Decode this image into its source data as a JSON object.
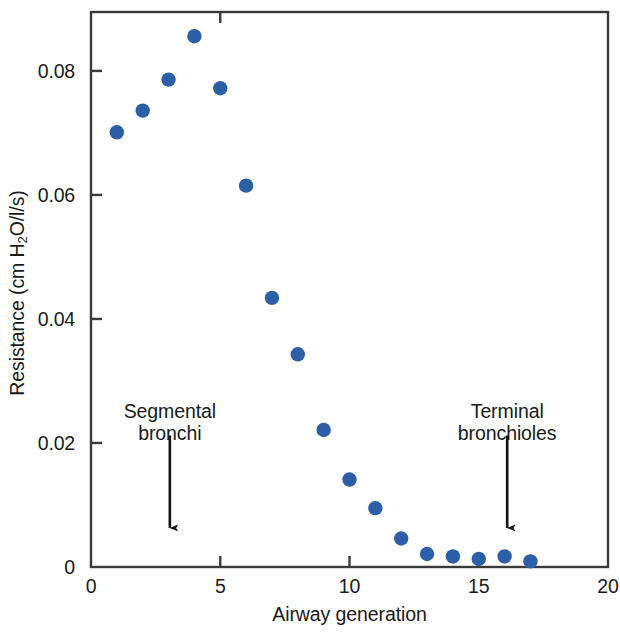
{
  "chart_data": {
    "type": "scatter",
    "title": "",
    "xlabel": "Airway generation",
    "ylabel": "Resistance (cm H2O/l/s)",
    "ylabel_parts": {
      "pre": "Resistance (cm H",
      "sub": "2",
      "post": "O/l/s)"
    },
    "xlim": [
      0,
      20
    ],
    "ylim": [
      0,
      0.0895
    ],
    "xticks": [
      0,
      5,
      10,
      15,
      20
    ],
    "xtick_labels": [
      "0",
      "5",
      "10",
      "15",
      "20"
    ],
    "yticks": [
      0,
      0.02,
      0.04,
      0.06,
      0.08
    ],
    "ytick_labels": [
      "0",
      "0.02",
      "0.04",
      "0.06",
      "0.08"
    ],
    "grid": false,
    "legend": null,
    "marker_color": "#2d5fa6",
    "axis_color": "#3a3a3a",
    "x": [
      1,
      2,
      3,
      4,
      5,
      6,
      7,
      8,
      9,
      10,
      11,
      12,
      13,
      14,
      15,
      16,
      17
    ],
    "values": [
      0.0701,
      0.0736,
      0.0786,
      0.0856,
      0.0772,
      0.0615,
      0.0434,
      0.0343,
      0.0221,
      0.0141,
      0.0095,
      0.0046,
      0.0021,
      0.0017,
      0.0013,
      0.0017,
      0.0009
    ],
    "points": [
      {
        "x": 1,
        "y": 0.0701
      },
      {
        "x": 2,
        "y": 0.0736
      },
      {
        "x": 3,
        "y": 0.0786
      },
      {
        "x": 4,
        "y": 0.0856
      },
      {
        "x": 5,
        "y": 0.0772
      },
      {
        "x": 6,
        "y": 0.0615
      },
      {
        "x": 7,
        "y": 0.0434
      },
      {
        "x": 8,
        "y": 0.0343
      },
      {
        "x": 9,
        "y": 0.0221
      },
      {
        "x": 10,
        "y": 0.0141
      },
      {
        "x": 11,
        "y": 0.0095
      },
      {
        "x": 12,
        "y": 0.0046
      },
      {
        "x": 13,
        "y": 0.0021
      },
      {
        "x": 14,
        "y": 0.0017
      },
      {
        "x": 15,
        "y": 0.0013
      },
      {
        "x": 16,
        "y": 0.0017
      },
      {
        "x": 17,
        "y": 0.0009
      }
    ],
    "annotations": [
      {
        "id": "segmental-bronchi",
        "line1": "Segmental",
        "line2": "bronchi",
        "text_x": 3.05,
        "text_y": 0.0268,
        "arrow_x": 3.05,
        "arrow_y_top": 0.0212,
        "arrow_y_bottom": 0.0063
      },
      {
        "id": "terminal-bronchioles",
        "line1": "Terminal",
        "line2": "bronchioles",
        "text_x": 16.1,
        "text_y": 0.0268,
        "arrow_x": 16.1,
        "arrow_y_top": 0.0212,
        "arrow_y_bottom": 0.0063
      }
    ]
  }
}
